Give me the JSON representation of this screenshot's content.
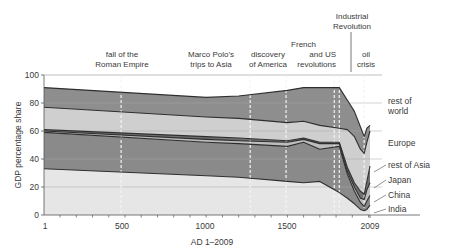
{
  "chart_data": {
    "type": "area",
    "stacked": true,
    "title": "",
    "xlabel": "AD 1–2009",
    "ylabel": "GDP percentage share",
    "xlim": [
      1,
      2009
    ],
    "ylim": [
      0,
      100
    ],
    "x_ticks": [
      1,
      500,
      1000,
      1500,
      2009
    ],
    "x_tick_labels": [
      "1",
      "500",
      "1000",
      "1500",
      "2009"
    ],
    "y_ticks": [
      0,
      20,
      40,
      60,
      80,
      100
    ],
    "y_tick_labels": [
      "0",
      "20",
      "40",
      "60",
      "80",
      "100"
    ],
    "grid": "horizontal",
    "legend_position": "right (inline labels)",
    "x": [
      1,
      1000,
      1200,
      1500,
      1600,
      1700,
      1820,
      1870,
      1913,
      1950,
      1973,
      1990,
      2009
    ],
    "series_cumulative_upper_bounds": "values below are each region's share; layers stack bottom to top",
    "series": [
      {
        "name": "India",
        "color": "#e6e6e6",
        "values": [
          33,
          28,
          27,
          24,
          23,
          24,
          16,
          12,
          8,
          4,
          3,
          4,
          7
        ]
      },
      {
        "name": "China",
        "color": "#8a8a8a",
        "values": [
          26,
          24,
          24,
          25,
          29,
          23,
          33,
          17,
          9,
          5,
          3,
          6,
          7
        ]
      },
      {
        "name": "Japan",
        "color": "#bdbdbd",
        "values": [
          1,
          2,
          2,
          3,
          2,
          4,
          2,
          2,
          3,
          3,
          5,
          8,
          9
        ]
      },
      {
        "name": "rest of Asia",
        "color": "#6f6f6f",
        "values": [
          1,
          2,
          2,
          1,
          1,
          1,
          1,
          3,
          3,
          5,
          4,
          6,
          12
        ]
      },
      {
        "name": "Europe",
        "color": "#cfcfcf",
        "values": [
          16,
          14,
          14,
          13,
          12,
          12,
          10,
          27,
          33,
          30,
          29,
          28,
          25
        ]
      },
      {
        "name": "rest of world",
        "color": "#8e8e8e",
        "values": [
          14,
          14,
          16,
          23,
          24,
          27,
          29,
          21,
          18,
          16,
          12,
          10,
          4
        ]
      }
    ],
    "top_remainder_color": "#ffffff",
    "annotations": [
      {
        "x": 476,
        "lines": [
          "fall of the",
          "Roman Empire"
        ]
      },
      {
        "x": 1271,
        "lines": [
          "Marco Polo's",
          "trips to Asia"
        ]
      },
      {
        "x": 1492,
        "lines": [
          "discovery",
          "of America"
        ]
      },
      {
        "x": 1789,
        "lines": [
          "French",
          "and US",
          "revolutions"
        ]
      },
      {
        "x": 1820,
        "lines": [
          "Industrial",
          "Revolution"
        ]
      },
      {
        "x": 1973,
        "lines": [
          "oil",
          "crisis"
        ]
      }
    ]
  },
  "labels": {
    "y_axis": "GDP percentage share",
    "x_axis": "AD 1–2009",
    "regions": {
      "rest_of_world": [
        "rest of",
        "world"
      ],
      "europe": "Europe",
      "rest_of_asia": "rest of Asia",
      "japan": "Japan",
      "china": "China",
      "india": "India"
    },
    "events": {
      "rome": [
        "fall of the",
        "Roman Empire"
      ],
      "polo": [
        "Marco Polo's",
        "trips to Asia"
      ],
      "america": [
        "discovery",
        "of America"
      ],
      "revolutions": [
        "French",
        "and US",
        "revolutions"
      ],
      "industrial": [
        "Industrial",
        "Revolution"
      ],
      "oil": [
        "oil",
        "crisis"
      ]
    },
    "x_ticks": [
      "1",
      "500",
      "1000",
      "1500",
      "2009"
    ],
    "y_ticks": [
      "0",
      "20",
      "40",
      "60",
      "80",
      "100"
    ]
  }
}
